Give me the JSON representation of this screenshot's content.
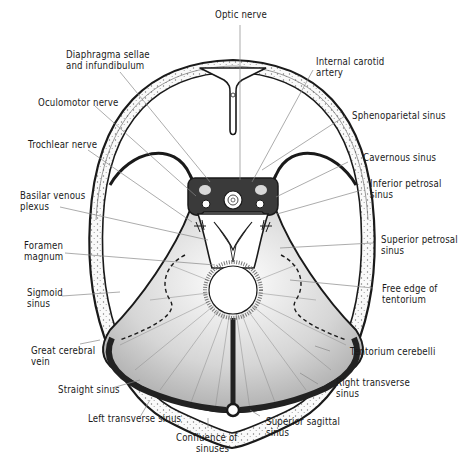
{
  "figure": {
    "type": "anatomical illustration",
    "colors": {
      "ink": "#1a1a1a",
      "leader": "#888888",
      "background": "#ffffff",
      "shading": "#9a9a9a"
    }
  },
  "labels": {
    "optic_nerve": {
      "line1": "Optic nerve"
    },
    "diaphragma": {
      "line1": "Diaphragma sellae",
      "line2": "and infundibulum"
    },
    "internal_carotid": {
      "line1": "Internal carotid",
      "line2": "artery"
    },
    "oculomotor": {
      "line1": "Oculomotor nerve"
    },
    "sphenoparietal": {
      "line1": "Sphenoparietal sinus"
    },
    "trochlear": {
      "line1": "Trochlear nerve"
    },
    "cavernous": {
      "line1": "Cavernous sinus"
    },
    "basilar": {
      "line1": "Basilar venous",
      "line2": "plexus"
    },
    "inferior_petrosal": {
      "line1": "Inferior petrosal",
      "line2": "sinus"
    },
    "foramen_magnum": {
      "line1": "Foramen",
      "line2": "magnum"
    },
    "superior_petrosal": {
      "line1": "Superior petrosal",
      "line2": "sinus"
    },
    "sigmoid": {
      "line1": "Sigmoid",
      "line2": "sinus"
    },
    "free_edge": {
      "line1": "Free edge of",
      "line2": "tentorium"
    },
    "great_cerebral": {
      "line1": "Great cerebral",
      "line2": "vein"
    },
    "tentorium": {
      "line1": "Tentorium cerebelli"
    },
    "straight": {
      "line1": "Straight sinus"
    },
    "right_transverse": {
      "line1": "Right transverse",
      "line2": "sinus"
    },
    "left_transverse": {
      "line1": "Left transverse sinus"
    },
    "superior_sagittal": {
      "line1": "Superior sagittal",
      "line2": "sinus"
    },
    "confluence": {
      "line1": "Confluence of",
      "line2": "sinuses"
    }
  }
}
